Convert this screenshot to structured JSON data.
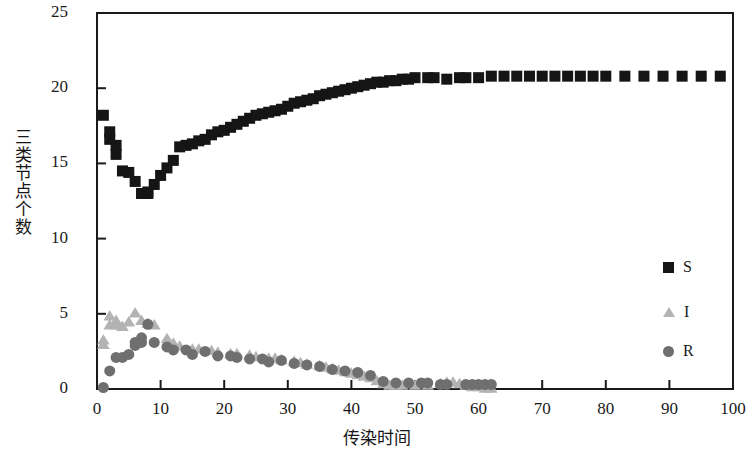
{
  "chart_data": {
    "type": "scatter",
    "title": "",
    "xlabel": "传染时间",
    "ylabel": "三类节点个数",
    "xlim": [
      0,
      100
    ],
    "ylim": [
      0,
      25
    ],
    "xticks": [
      0,
      10,
      20,
      30,
      40,
      50,
      60,
      70,
      80,
      90,
      100
    ],
    "yticks": [
      0,
      5,
      10,
      15,
      20,
      25
    ],
    "grid": false,
    "legend_position": "right-middle",
    "series": [
      {
        "name": "S",
        "marker": "square",
        "color": "#151515",
        "points": [
          [
            1,
            18.2
          ],
          [
            2,
            17.1
          ],
          [
            2,
            16.6
          ],
          [
            3,
            16.2
          ],
          [
            3,
            15.6
          ],
          [
            4,
            14.5
          ],
          [
            5,
            14.4
          ],
          [
            6,
            13.8
          ],
          [
            7,
            13.0
          ],
          [
            8,
            13.0
          ],
          [
            8,
            13.1
          ],
          [
            9,
            13.6
          ],
          [
            10,
            14.2
          ],
          [
            11,
            14.7
          ],
          [
            12,
            15.2
          ],
          [
            13,
            16.1
          ],
          [
            14,
            16.2
          ],
          [
            15,
            16.3
          ],
          [
            16,
            16.5
          ],
          [
            17,
            16.6
          ],
          [
            18,
            16.9
          ],
          [
            19,
            17.1
          ],
          [
            20,
            17.2
          ],
          [
            21,
            17.4
          ],
          [
            22,
            17.6
          ],
          [
            23,
            17.8
          ],
          [
            24,
            18.0
          ],
          [
            25,
            18.2
          ],
          [
            26,
            18.3
          ],
          [
            27,
            18.4
          ],
          [
            28,
            18.5
          ],
          [
            29,
            18.6
          ],
          [
            30,
            18.8
          ],
          [
            31,
            19.0
          ],
          [
            32,
            19.1
          ],
          [
            33,
            19.2
          ],
          [
            34,
            19.3
          ],
          [
            35,
            19.5
          ],
          [
            36,
            19.6
          ],
          [
            37,
            19.7
          ],
          [
            38,
            19.8
          ],
          [
            39,
            19.9
          ],
          [
            40,
            20.0
          ],
          [
            41,
            20.1
          ],
          [
            42,
            20.2
          ],
          [
            43,
            20.3
          ],
          [
            44,
            20.4
          ],
          [
            45,
            20.4
          ],
          [
            46,
            20.5
          ],
          [
            47,
            20.5
          ],
          [
            48,
            20.6
          ],
          [
            49,
            20.6
          ],
          [
            50,
            20.7
          ],
          [
            52,
            20.7
          ],
          [
            53,
            20.7
          ],
          [
            55,
            20.6
          ],
          [
            57,
            20.7
          ],
          [
            58,
            20.7
          ],
          [
            60,
            20.7
          ],
          [
            62,
            20.8
          ],
          [
            64,
            20.8
          ],
          [
            66,
            20.8
          ],
          [
            68,
            20.8
          ],
          [
            70,
            20.8
          ],
          [
            72,
            20.8
          ],
          [
            74,
            20.8
          ],
          [
            76,
            20.8
          ],
          [
            78,
            20.8
          ],
          [
            80,
            20.8
          ],
          [
            83,
            20.8
          ],
          [
            86,
            20.8
          ],
          [
            89,
            20.8
          ],
          [
            92,
            20.8
          ],
          [
            95,
            20.8
          ],
          [
            98,
            20.8
          ]
        ]
      },
      {
        "name": "I",
        "marker": "triangle",
        "color": "#b3b3b3",
        "points": [
          [
            1,
            3.3
          ],
          [
            1,
            3.0
          ],
          [
            2,
            4.3
          ],
          [
            2,
            4.9
          ],
          [
            3,
            4.6
          ],
          [
            3,
            4.3
          ],
          [
            4,
            4.2
          ],
          [
            5,
            4.5
          ],
          [
            6,
            5.1
          ],
          [
            7,
            4.6
          ],
          [
            8,
            4.4
          ],
          [
            9,
            4.3
          ],
          [
            11,
            3.4
          ],
          [
            12,
            3.1
          ],
          [
            13,
            2.9
          ],
          [
            15,
            2.7
          ],
          [
            16,
            2.7
          ],
          [
            18,
            2.6
          ],
          [
            19,
            2.5
          ],
          [
            21,
            2.4
          ],
          [
            22,
            2.4
          ],
          [
            24,
            2.3
          ],
          [
            25,
            2.2
          ],
          [
            27,
            2.1
          ],
          [
            28,
            2.1
          ],
          [
            29,
            2.0
          ],
          [
            31,
            1.9
          ],
          [
            32,
            1.8
          ],
          [
            33,
            1.7
          ],
          [
            35,
            1.6
          ],
          [
            36,
            1.5
          ],
          [
            37,
            1.4
          ],
          [
            38,
            1.3
          ],
          [
            39,
            1.2
          ],
          [
            40,
            1.1
          ],
          [
            41,
            1.0
          ],
          [
            42,
            0.9
          ],
          [
            43,
            0.8
          ],
          [
            44,
            0.6
          ],
          [
            45,
            0.4
          ],
          [
            46,
            0.3
          ],
          [
            47,
            0.3
          ],
          [
            48,
            0.3
          ],
          [
            50,
            0.3
          ],
          [
            52,
            0.3
          ],
          [
            54,
            0.4
          ],
          [
            55,
            0.5
          ],
          [
            56,
            0.5
          ],
          [
            57,
            0.4
          ],
          [
            58,
            0.3
          ],
          [
            59,
            0.2
          ],
          [
            60,
            0.2
          ],
          [
            61,
            0.1
          ],
          [
            62,
            0.1
          ]
        ]
      },
      {
        "name": "R",
        "marker": "circle",
        "color": "#6f6f6f",
        "points": [
          [
            1,
            0.1
          ],
          [
            2,
            1.2
          ],
          [
            3,
            2.1
          ],
          [
            4,
            2.1
          ],
          [
            5,
            2.3
          ],
          [
            6,
            2.9
          ],
          [
            6,
            3.1
          ],
          [
            7,
            3.1
          ],
          [
            7,
            3.4
          ],
          [
            8,
            4.3
          ],
          [
            9,
            3.1
          ],
          [
            11,
            2.8
          ],
          [
            12,
            2.6
          ],
          [
            14,
            2.6
          ],
          [
            15,
            2.3
          ],
          [
            17,
            2.5
          ],
          [
            19,
            2.2
          ],
          [
            21,
            2.2
          ],
          [
            22,
            2.1
          ],
          [
            24,
            2.0
          ],
          [
            26,
            2.0
          ],
          [
            27,
            1.8
          ],
          [
            29,
            1.9
          ],
          [
            31,
            1.7
          ],
          [
            33,
            1.6
          ],
          [
            35,
            1.5
          ],
          [
            37,
            1.3
          ],
          [
            39,
            1.2
          ],
          [
            41,
            1.1
          ],
          [
            43,
            0.9
          ],
          [
            45,
            0.5
          ],
          [
            47,
            0.4
          ],
          [
            49,
            0.4
          ],
          [
            51,
            0.4
          ],
          [
            52,
            0.4
          ],
          [
            54,
            0.3
          ],
          [
            55,
            0.3
          ],
          [
            58,
            0.3
          ],
          [
            59,
            0.3
          ],
          [
            60,
            0.3
          ],
          [
            61,
            0.3
          ],
          [
            62,
            0.3
          ]
        ]
      }
    ]
  },
  "legend": {
    "items": [
      {
        "label": "S",
        "marker": "square",
        "color": "#151515"
      },
      {
        "label": "I",
        "marker": "triangle",
        "color": "#b3b3b3"
      },
      {
        "label": "R",
        "marker": "circle",
        "color": "#6f6f6f"
      }
    ]
  },
  "axes": {
    "x_title": "传染时间",
    "y_title": "三类节点个数",
    "x_tick_labels": [
      "0",
      "10",
      "20",
      "30",
      "40",
      "50",
      "60",
      "70",
      "80",
      "90",
      "100"
    ],
    "y_tick_labels": [
      "0",
      "5",
      "10",
      "15",
      "20",
      "25"
    ]
  }
}
